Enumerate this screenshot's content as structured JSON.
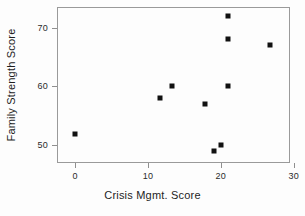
{
  "chart_data": {
    "type": "scatter",
    "title": "",
    "xlabel": "Crisis Mgmt. Score",
    "ylabel": "Family Strength Score",
    "xlim": [
      -2.5,
      29.5
    ],
    "ylim": [
      47.0,
      73.5
    ],
    "xticks": [
      0,
      10,
      20,
      30
    ],
    "xtick_labels": [
      "0",
      "10",
      "20",
      "30"
    ],
    "yticks": [
      50,
      60,
      70
    ],
    "ytick_labels": [
      "50",
      "60",
      "70"
    ],
    "grid": false,
    "legend": null,
    "marker": "filled-square",
    "marker_color": "#111111",
    "frame_color": "#9a9a9a",
    "background": "#fdfdfd",
    "points": [
      {
        "x": 0,
        "y": 52
      },
      {
        "x": 11.6,
        "y": 58
      },
      {
        "x": 13.3,
        "y": 60
      },
      {
        "x": 17.8,
        "y": 57
      },
      {
        "x": 19,
        "y": 49
      },
      {
        "x": 20,
        "y": 50
      },
      {
        "x": 21,
        "y": 60
      },
      {
        "x": 21,
        "y": 68
      },
      {
        "x": 21,
        "y": 72
      },
      {
        "x": 26.8,
        "y": 67
      }
    ],
    "x": [
      0,
      11.6,
      13.3,
      17.8,
      19,
      20,
      21,
      21,
      21,
      26.8
    ],
    "values": [
      52,
      58,
      60,
      57,
      49,
      50,
      60,
      68,
      72,
      67
    ]
  }
}
